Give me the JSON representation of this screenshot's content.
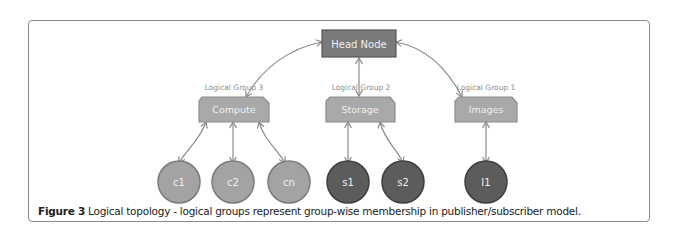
{
  "figure": {
    "caption_label": "Figure 3",
    "caption_text": " Logical topology - logical groups represent group-wise membership in publisher/subscriber model."
  },
  "nodes": {
    "head": {
      "label": "Head Node",
      "fill": "#7a7a7a",
      "stroke": "#555555"
    },
    "groups": [
      {
        "id": "compute",
        "label": "Compute",
        "group_label": "Logical Group 3"
      },
      {
        "id": "storage",
        "label": "Storage",
        "group_label": "Logical Group 2"
      },
      {
        "id": "images",
        "label": "Images",
        "group_label": "Logical Group 1"
      }
    ],
    "members": [
      {
        "label": "c1",
        "group": "compute",
        "shade": "light"
      },
      {
        "label": "c2",
        "group": "compute",
        "shade": "light"
      },
      {
        "label": "cn",
        "group": "compute",
        "shade": "light"
      },
      {
        "label": "s1",
        "group": "storage",
        "shade": "dark"
      },
      {
        "label": "s2",
        "group": "storage",
        "shade": "dark"
      },
      {
        "label": "I1",
        "group": "images",
        "shade": "dark"
      }
    ]
  },
  "colors": {
    "group_fill": "#a9a9a9",
    "group_stroke": "#8c8c8c",
    "light_member_fill": "#a3a3a3",
    "light_member_stroke": "#7a7a7a",
    "dark_member_fill": "#5c5c5c",
    "dark_member_stroke": "#3e3e3e",
    "arrow": "#8a8a8a",
    "node_text": "#f0f0f0",
    "group_label_text": "#8a8a8a"
  }
}
